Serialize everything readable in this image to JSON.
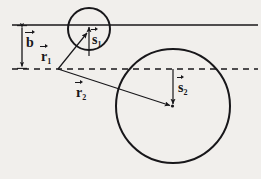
{
  "figure": {
    "type": "vector-geometry-diagram",
    "caption": "",
    "background_color": "#f1efec",
    "stroke_color": "#18171a",
    "labels": {
      "b": {
        "symbol": "b",
        "subscript": "",
        "name": "impact-parameter-b"
      },
      "r1": {
        "symbol": "r",
        "subscript": "1",
        "name": "position-vector-r1"
      },
      "r2": {
        "symbol": "r",
        "subscript": "2",
        "name": "position-vector-r2"
      },
      "s1": {
        "symbol": "s",
        "subscript": "1",
        "name": "spin-vector-s1"
      },
      "s2": {
        "symbol": "s",
        "subscript": "2",
        "name": "spin-vector-s2"
      }
    },
    "geometry": {
      "solid_line": {
        "y": 25,
        "x_start": 12,
        "x_end": 258
      },
      "dashed_line": {
        "y": 69,
        "x_start": 12,
        "x_end": 258,
        "dash": "6,5"
      },
      "b_bracket": {
        "x": 22,
        "y_top": 25,
        "y_bottom": 69,
        "double_headed": true
      },
      "small_circle": {
        "cx": 89,
        "cy": 29,
        "r": 21
      },
      "large_circle": {
        "cx": 173,
        "cy": 106,
        "r": 57
      },
      "origin_point": {
        "x": 58,
        "y": 69
      },
      "vector_r1": {
        "x1": 58,
        "y1": 69,
        "x2": 88,
        "y2": 32
      },
      "vector_r2": {
        "x1": 58,
        "y1": 69,
        "x2": 171,
        "y2": 106
      },
      "vector_s1": {
        "x1": 89,
        "y1": 55,
        "x2": 89,
        "y2": 26
      },
      "vector_s2": {
        "x1": 173,
        "y1": 69,
        "x2": 173,
        "y2": 105
      }
    }
  }
}
